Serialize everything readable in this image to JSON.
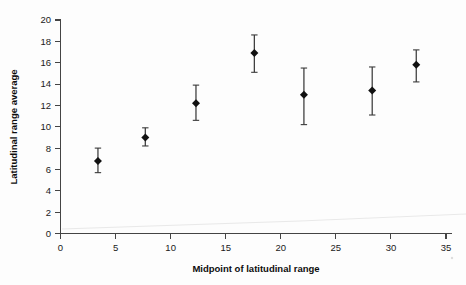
{
  "chart_data": {
    "type": "scatter",
    "title": "",
    "xlabel": "Midpoint of latitudinal range",
    "ylabel": "Latitudinal range average",
    "xlim": [
      0,
      35
    ],
    "ylim": [
      0,
      20
    ],
    "xticks": [
      0,
      5,
      10,
      15,
      20,
      25,
      30,
      35
    ],
    "yticks": [
      0,
      2,
      4,
      6,
      8,
      10,
      12,
      14,
      16,
      18,
      20
    ],
    "grid": false,
    "legend": null,
    "marker": "diamond",
    "error_bars": "vertical",
    "series": [
      {
        "name": "Latitudinal range average",
        "points": [
          {
            "x": 3.4,
            "y": 6.8,
            "yerr_low": 5.7,
            "yerr_high": 8.0
          },
          {
            "x": 7.7,
            "y": 9.0,
            "yerr_low": 8.2,
            "yerr_high": 9.9
          },
          {
            "x": 12.3,
            "y": 12.2,
            "yerr_low": 10.6,
            "yerr_high": 13.9
          },
          {
            "x": 17.6,
            "y": 16.9,
            "yerr_low": 15.1,
            "yerr_high": 18.6
          },
          {
            "x": 22.1,
            "y": 13.0,
            "yerr_low": 10.2,
            "yerr_high": 15.5
          },
          {
            "x": 28.3,
            "y": 13.4,
            "yerr_low": 11.1,
            "yerr_high": 15.6
          },
          {
            "x": 32.3,
            "y": 15.8,
            "yerr_low": 14.2,
            "yerr_high": 17.2
          }
        ]
      }
    ]
  },
  "axes": {
    "x_title": "Midpoint of latitudinal range",
    "y_title": "Latitudinal range average",
    "x_tick_labels": [
      "0",
      "5",
      "10",
      "15",
      "20",
      "25",
      "30",
      "35"
    ],
    "y_tick_labels": [
      "0",
      "2",
      "4",
      "6",
      "8",
      "10",
      "12",
      "14",
      "16",
      "18",
      "20"
    ]
  },
  "colors": {
    "marker": "#111111",
    "error_bar": "#3b3b3b",
    "axis": "#444444",
    "text": "#1a1a1a",
    "background": "#ffffff"
  }
}
